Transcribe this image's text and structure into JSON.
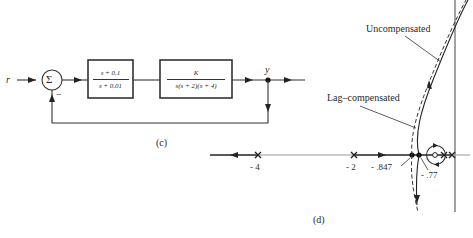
{
  "figure": {
    "panel_c": {
      "caption": "(c)",
      "input_label": "r",
      "output_label": "y",
      "summing_symbol": "Σ",
      "feedback_sign": "−",
      "blocks": [
        {
          "name": "lag-compensator",
          "numerator": "s + 0.1",
          "denominator": "s + 0.01"
        },
        {
          "name": "plant",
          "numerator": "K",
          "denominator": "s(s + 2)(s + 4)"
        }
      ]
    },
    "panel_d": {
      "caption": "(d)",
      "curve_labels": {
        "uncompensated": "Uncompensated",
        "lag_compensated": "Lag–compensated"
      },
      "axis_labels": {
        "pole_neg4": "- 4",
        "pole_neg2": "- 2",
        "breakaway_uncomp": "- .847",
        "breakaway_comp": "- .77"
      }
    }
  },
  "colors": {
    "line": "#333333",
    "background": "#ffffff"
  }
}
